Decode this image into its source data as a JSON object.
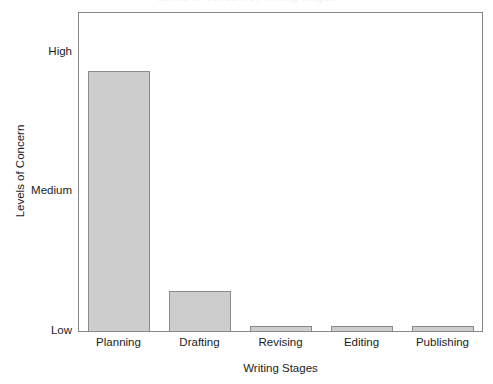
{
  "chart_data": {
    "type": "bar",
    "title": "",
    "xlabel": "Writing Stages",
    "ylabel": "Levels of Concern",
    "categories": [
      "Planning",
      "Drafting",
      "Revising",
      "Editing",
      "Publishing"
    ],
    "values": [
      1.87,
      0.29,
      0.04,
      0.04,
      0.04
    ],
    "ytick_labels": [
      "High",
      "Medium",
      "Low"
    ],
    "ytick_values": [
      2,
      1,
      0
    ],
    "ylim": [
      0,
      2.29
    ],
    "grid": false,
    "legend": null,
    "bar_fill_color": "#cdcdcd",
    "bar_edge_color": "#8a8a8a",
    "axis_color": "#878787",
    "text_color": "#1c1c1c",
    "background_color": "#ffffff"
  },
  "figure": {
    "clipped_title": "Levels of Concern by Writing Stages"
  }
}
